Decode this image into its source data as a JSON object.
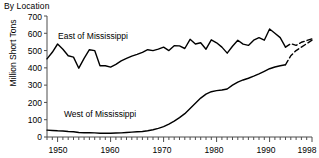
{
  "chart_data": {
    "type": "line",
    "title": "By Location",
    "subtitle": "",
    "xlabel": "",
    "ylabel": "Million Short Tons",
    "xlim": [
      1948,
      1998
    ],
    "ylim": [
      0,
      700
    ],
    "ytick_values": [
      0,
      100,
      200,
      300,
      400,
      500,
      600,
      700
    ],
    "ytick_labels": [
      "0",
      "100",
      "200",
      "300",
      "400",
      "500",
      "600",
      "700"
    ],
    "xtick_values": [
      1950,
      1960,
      1970,
      1980,
      1990,
      1998
    ],
    "xtick_labels": [
      "1950",
      "1960",
      "1970",
      "1980",
      "1990",
      "1998"
    ],
    "xtick_minor_step": 1,
    "grid": false,
    "legend": "inline-annotations",
    "annotations": [
      {
        "text": "East of Mississippi",
        "x": 1954.0,
        "y": 585
      },
      {
        "text": "West of Mississippi",
        "x": 1962.5,
        "y": 98
      }
    ],
    "series": [
      {
        "name": "East of Mississippi",
        "color": "#000000",
        "x": [
          1948,
          1949,
          1950,
          1951,
          1952,
          1953,
          1954,
          1955,
          1956,
          1957,
          1958,
          1959,
          1960,
          1961,
          1962,
          1963,
          1964,
          1965,
          1966,
          1967,
          1968,
          1969,
          1970,
          1971,
          1972,
          1973,
          1974,
          1975,
          1976,
          1977,
          1978,
          1979,
          1980,
          1981,
          1982,
          1983,
          1984,
          1985,
          1986,
          1987,
          1988,
          1989,
          1990,
          1991,
          1992,
          1993,
          1994,
          1995,
          1996,
          1997,
          1998
        ],
        "values": [
          452,
          490,
          538,
          508,
          470,
          462,
          398,
          455,
          505,
          500,
          412,
          412,
          404,
          420,
          440,
          455,
          468,
          478,
          490,
          505,
          500,
          508,
          520,
          500,
          528,
          527,
          512,
          565,
          538,
          545,
          508,
          562,
          545,
          520,
          485,
          525,
          560,
          537,
          530,
          560,
          575,
          560,
          625,
          600,
          575,
          520,
          540,
          530,
          548,
          558,
          568
        ],
        "dashed_from": 1993,
        "dashed_note": "dashed segment near 1993-1996"
      },
      {
        "name": "West of Mississippi",
        "color": "#000000",
        "x": [
          1948,
          1949,
          1950,
          1951,
          1952,
          1953,
          1954,
          1955,
          1956,
          1957,
          1958,
          1959,
          1960,
          1961,
          1962,
          1963,
          1964,
          1965,
          1966,
          1967,
          1968,
          1969,
          1970,
          1971,
          1972,
          1973,
          1974,
          1975,
          1976,
          1977,
          1978,
          1979,
          1980,
          1981,
          1982,
          1983,
          1984,
          1985,
          1986,
          1987,
          1988,
          1989,
          1990,
          1991,
          1992,
          1993,
          1994,
          1995,
          1996,
          1997,
          1998
        ],
        "values": [
          40,
          38,
          36,
          35,
          32,
          30,
          26,
          25,
          25,
          24,
          22,
          22,
          22,
          23,
          24,
          26,
          28,
          30,
          32,
          36,
          42,
          50,
          60,
          75,
          92,
          112,
          135,
          165,
          195,
          225,
          248,
          262,
          268,
          272,
          278,
          300,
          318,
          330,
          340,
          352,
          365,
          380,
          395,
          405,
          412,
          418,
          470,
          500,
          520,
          540,
          560
        ],
        "dashed_from": 1993,
        "dashed_note": "dashed segment near 1993-1996"
      }
    ]
  }
}
